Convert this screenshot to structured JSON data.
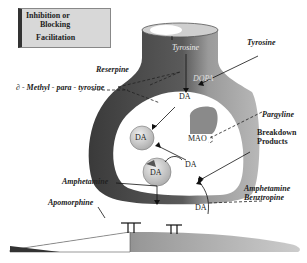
{
  "legend": {
    "inhibition_label_1": "Inhibition or",
    "inhibition_label_2": "Blocking",
    "facilitation_label": "Facilitation"
  },
  "neuron": {
    "tyrosine_inside": "Tyrosine",
    "dopa_inside": "DOPA"
  },
  "labels": {
    "tyrosine_external": "Tyrosine",
    "reserpine": "Reserpine",
    "methyl_para_tyrosine": "∂ - Methyl - para - tyrosine",
    "pargyline": "Pargyline",
    "breakdown_1": "Breakdown",
    "breakdown_2": "Products",
    "amphetamine_left": "Amphetamine",
    "amphetamine_right": "Amphetamine",
    "benztropine": "Benztropine",
    "apomorphine": "Apomorphine",
    "mao": "MAO",
    "da_top": "DA",
    "da_vesicle_1": "DA",
    "da_vesicle_2": "DA",
    "da_middle": "DA",
    "da_bottom": "DA"
  },
  "colors": {
    "neuron_dark": "#4a4a4a",
    "neuron_light": "#a8a8a8",
    "vesicle": "#c8c8c8",
    "legend_bg": "#d8d8d8"
  }
}
